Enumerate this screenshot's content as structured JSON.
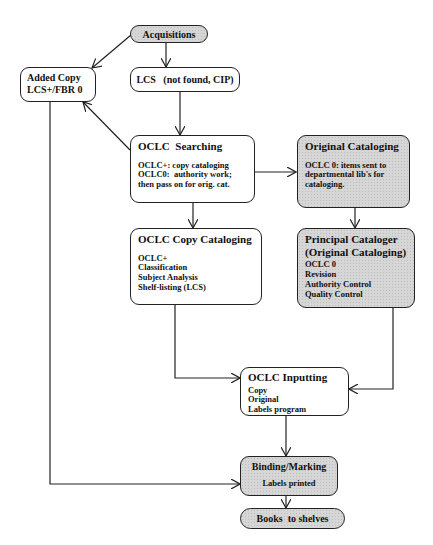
{
  "diagram": {
    "type": "flowchart",
    "nodes": {
      "acquisitions": {
        "title": "Acquisitions",
        "shaded": true
      },
      "added_copy": {
        "lines": [
          "Added Copy",
          "LCS+/FBR 0"
        ]
      },
      "lcs": {
        "title": "LCS   (not found, CIP)"
      },
      "oclc_searching": {
        "title": "OCLC  Searching",
        "lines": [
          "OCLC+: copy cataloging",
          "OCLC0:  authority work;",
          "then pass on for orig. cat."
        ]
      },
      "original_cataloging": {
        "title": "Original Cataloging",
        "lines": [
          "OCLC 0: items sent to",
          "departmental lib's for",
          "cataloging."
        ],
        "shaded": true
      },
      "oclc_copy_cataloging": {
        "title": "OCLC Copy Cataloging",
        "lines": [
          "OCLC+",
          "Classification",
          "Subject Analysis",
          "Shelf-listing (LCS)"
        ]
      },
      "principal_cataloger": {
        "title": "Principal Cataloger",
        "title2": "(Original Cataloging)",
        "lines": [
          "OCLC 0",
          "Revision",
          "Authority Control",
          "Quality Control"
        ],
        "shaded": true
      },
      "oclc_inputting": {
        "title": "OCLC Inputting",
        "lines": [
          "Copy",
          "Original",
          "Labels program"
        ]
      },
      "binding_marking": {
        "title": "Binding/Marking",
        "lines": [
          "Labels printed"
        ],
        "shaded": true
      },
      "books_to_shelves": {
        "title": "Books  to shelves",
        "shaded": true
      }
    },
    "edges": [
      [
        "acquisitions",
        "added_copy"
      ],
      [
        "acquisitions",
        "lcs"
      ],
      [
        "lcs",
        "oclc_searching"
      ],
      [
        "oclc_searching",
        "added_copy"
      ],
      [
        "oclc_searching",
        "original_cataloging"
      ],
      [
        "oclc_searching",
        "oclc_copy_cataloging"
      ],
      [
        "original_cataloging",
        "principal_cataloger"
      ],
      [
        "oclc_copy_cataloging",
        "oclc_inputting"
      ],
      [
        "principal_cataloger",
        "oclc_inputting"
      ],
      [
        "added_copy",
        "binding_marking"
      ],
      [
        "oclc_inputting",
        "binding_marking"
      ],
      [
        "binding_marking",
        "books_to_shelves"
      ]
    ],
    "colors": {
      "line": "#222222",
      "shaded_fill": "#d6d6d6",
      "plain_fill": "#ffffff"
    }
  }
}
